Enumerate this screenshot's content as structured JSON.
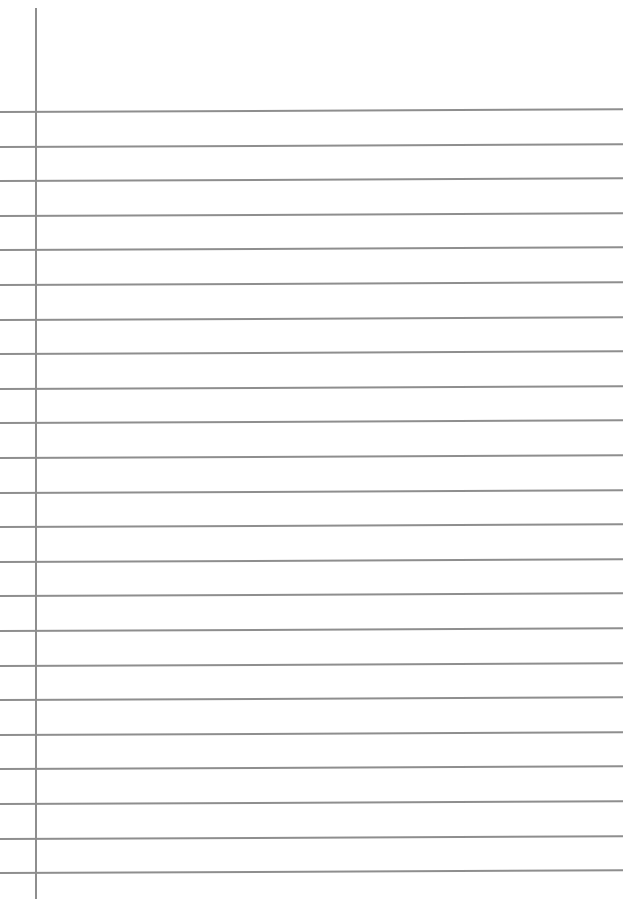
{
  "page": {
    "type": "lined-paper",
    "background_color": "#ffffff",
    "line_color": "#8e8e8e",
    "margin_line": {
      "x": 35,
      "top": 8,
      "bottom": 899
    },
    "rule_lines": {
      "count": 23,
      "first_y": 111,
      "spacing": 34.6,
      "right_end_x": 623
    }
  }
}
